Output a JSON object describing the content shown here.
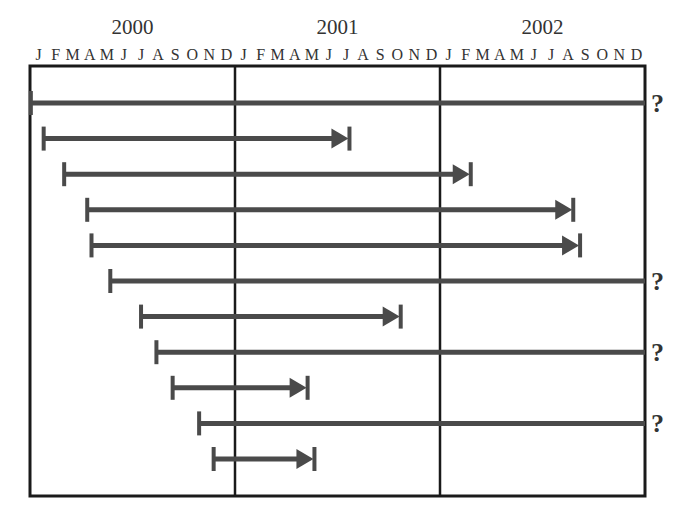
{
  "chart_data": {
    "type": "timeline",
    "title": "",
    "years": [
      "2000",
      "2001",
      "2002"
    ],
    "month_labels": [
      "J",
      "F",
      "M",
      "A",
      "M",
      "J",
      "J",
      "A",
      "S",
      "O",
      "N",
      "D"
    ],
    "xlabel": "",
    "ylabel": "",
    "x_unit": "months since Jan 2000",
    "xlim": [
      0,
      36
    ],
    "grid": "vertical lines at year boundaries",
    "colors": {
      "bar": "#4a4a4a",
      "frame": "#1a1a1a"
    },
    "ongoing_marker": "?",
    "bars": [
      {
        "start": 0.05,
        "end": 36,
        "ongoing": true
      },
      {
        "start": 0.8,
        "end": 18.7,
        "ongoing": false
      },
      {
        "start": 2.0,
        "end": 25.8,
        "ongoing": false
      },
      {
        "start": 3.35,
        "end": 31.8,
        "ongoing": false
      },
      {
        "start": 3.6,
        "end": 32.2,
        "ongoing": false
      },
      {
        "start": 4.7,
        "end": 36,
        "ongoing": true
      },
      {
        "start": 6.5,
        "end": 21.7,
        "ongoing": false
      },
      {
        "start": 7.4,
        "end": 36,
        "ongoing": true
      },
      {
        "start": 8.35,
        "end": 16.25,
        "ongoing": false
      },
      {
        "start": 9.9,
        "end": 36,
        "ongoing": true
      },
      {
        "start": 10.75,
        "end": 16.65,
        "ongoing": false
      }
    ]
  }
}
